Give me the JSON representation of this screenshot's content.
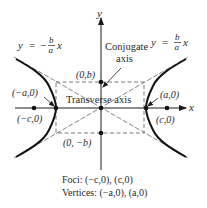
{
  "diagram": {
    "colors": {
      "ink": "#1a1a1a",
      "dash": "#555555",
      "background": "#ffffff"
    },
    "axes": {
      "x_label": "x",
      "y_label": "y"
    },
    "asymptotes": {
      "left": {
        "lhs": "y",
        "eq": "=",
        "sign": "−",
        "num": "b",
        "den": "a",
        "var": "x"
      },
      "right": {
        "lhs": "y",
        "eq": "=",
        "num": "b",
        "den": "a",
        "var": "x"
      }
    },
    "points": {
      "top": "(0,b)",
      "bottom": "(0, −b)",
      "left_vertex": "(−a,0)",
      "right_vertex": "(a,0)",
      "left_focus": "(−c,0)",
      "right_focus": "(c,0)"
    },
    "labels": {
      "conjugate_line1": "Conjugate",
      "conjugate_line2": "axis",
      "transverse": "Transverse axis"
    },
    "caption": {
      "foci": "Foci: (−c,0), (c,0)",
      "vertices": "Vertices: (−a,0), (a,0)"
    }
  }
}
